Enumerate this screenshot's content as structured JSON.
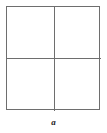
{
  "figure": {
    "caption": "a",
    "shape_name": "square-divided-in-four",
    "background_color": "#ffffff",
    "line_color": "#6e6e6e",
    "caption_color": "#1a1a1a",
    "quadrants": [
      {
        "position": "top-left",
        "label": ""
      },
      {
        "position": "top-right",
        "label": ""
      },
      {
        "position": "bottom-left",
        "label": ""
      },
      {
        "position": "bottom-right",
        "label": ""
      }
    ]
  }
}
